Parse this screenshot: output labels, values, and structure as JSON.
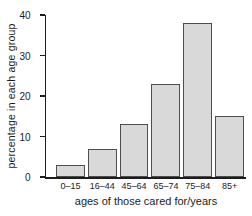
{
  "chart_data": {
    "type": "bar",
    "categories": [
      "0–15",
      "16–44",
      "45–64",
      "65–74",
      "75–84",
      "85+"
    ],
    "values": [
      3,
      7,
      13,
      23,
      38,
      15
    ],
    "xlabel": "ages of those cared for/years",
    "ylabel": "percentage in each age group",
    "ylim": [
      0,
      40
    ],
    "yticks": [
      0,
      10,
      20,
      30,
      40
    ],
    "grid": false,
    "legend": false,
    "bar_fill": "#d9d9d9",
    "bar_border": "#4d4d4d",
    "axis_color": "#1c1c1c",
    "text_color": "#1c1c1c",
    "background": "#ffffff"
  }
}
